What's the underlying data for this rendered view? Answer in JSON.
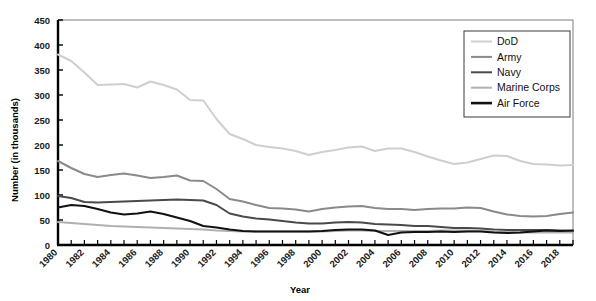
{
  "chart_data": {
    "type": "line",
    "title": "",
    "xlabel": "Year",
    "ylabel": "Number (in thousands)",
    "xlim": [
      1980,
      2019
    ],
    "ylim": [
      0,
      450
    ],
    "ytick_step": 50,
    "yticks": [
      0,
      50,
      100,
      150,
      200,
      250,
      300,
      350,
      400,
      450
    ],
    "xticks_labeled": [
      1980,
      1982,
      1984,
      1986,
      1988,
      1990,
      1992,
      1994,
      1996,
      1998,
      2000,
      2002,
      2004,
      2006,
      2008,
      2010,
      2012,
      2014,
      2016,
      2018
    ],
    "xtick_every": 1,
    "grid": false,
    "legend_position": "top-right",
    "x": [
      1980,
      1981,
      1982,
      1983,
      1984,
      1985,
      1986,
      1987,
      1988,
      1989,
      1990,
      1991,
      1992,
      1993,
      1994,
      1995,
      1996,
      1997,
      1998,
      1999,
      2000,
      2001,
      2002,
      2003,
      2004,
      2005,
      2006,
      2007,
      2008,
      2009,
      2010,
      2011,
      2012,
      2013,
      2014,
      2015,
      2016,
      2017,
      2018,
      2019
    ],
    "series": [
      {
        "name": "DoD",
        "color": "#cfcfcf",
        "width": 2.0,
        "values": [
          381,
          368,
          345,
          320,
          321,
          322,
          315,
          327,
          320,
          311,
          290,
          289,
          252,
          222,
          212,
          200,
          196,
          193,
          188,
          180,
          186,
          190,
          195,
          197,
          188,
          193,
          193,
          186,
          177,
          169,
          162,
          165,
          172,
          179,
          178,
          168,
          162,
          161,
          159,
          160
        ]
      },
      {
        "name": "Army",
        "color": "#8a8a8a",
        "width": 2.0,
        "values": [
          168,
          154,
          142,
          136,
          140,
          143,
          139,
          134,
          136,
          139,
          129,
          128,
          112,
          92,
          87,
          80,
          74,
          73,
          71,
          67,
          72,
          75,
          77,
          78,
          74,
          72,
          72,
          70,
          72,
          73,
          73,
          75,
          74,
          67,
          61,
          58,
          57,
          58,
          62,
          65
        ]
      },
      {
        "name": "Navy",
        "color": "#4a4a4a",
        "width": 2.0,
        "values": [
          98,
          94,
          86,
          85,
          86,
          87,
          88,
          89,
          90,
          91,
          90,
          89,
          80,
          63,
          57,
          53,
          51,
          48,
          45,
          43,
          43,
          45,
          46,
          45,
          42,
          41,
          40,
          38,
          38,
          36,
          34,
          34,
          33,
          31,
          30,
          30,
          30,
          30,
          29,
          28
        ]
      },
      {
        "name": "Marine Corps",
        "color": "#b0b0b0",
        "width": 2.0,
        "values": [
          46,
          44,
          42,
          40,
          38,
          37,
          36,
          35,
          34,
          33,
          32,
          31,
          29,
          28,
          27,
          27,
          27,
          27,
          27,
          27,
          27,
          28,
          29,
          29,
          28,
          28,
          28,
          28,
          28,
          29,
          29,
          29,
          28,
          27,
          26,
          25,
          25,
          25,
          25,
          25
        ]
      },
      {
        "name": "Air Force",
        "color": "#111111",
        "width": 2.0,
        "values": [
          75,
          80,
          78,
          72,
          65,
          61,
          63,
          67,
          62,
          55,
          48,
          38,
          35,
          31,
          28,
          27,
          27,
          27,
          27,
          27,
          28,
          30,
          31,
          31,
          29,
          20,
          25,
          26,
          26,
          27,
          26,
          27,
          27,
          25,
          24,
          25,
          27,
          29,
          28,
          29
        ]
      }
    ]
  },
  "legend": {
    "items": [
      {
        "label": "DoD"
      },
      {
        "label": "Army"
      },
      {
        "label": "Navy"
      },
      {
        "label": "Marine Corps"
      },
      {
        "label": "Air Force"
      }
    ]
  }
}
